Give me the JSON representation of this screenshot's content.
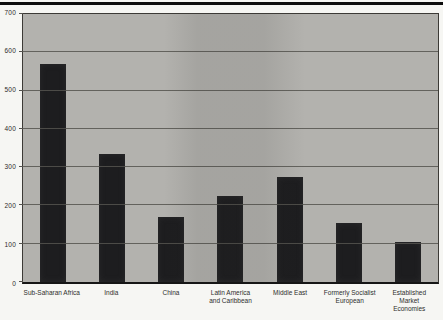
{
  "figure": {
    "background_color": "#f6f6f3",
    "top_rule_color": "#0d0d0d"
  },
  "chart_data": {
    "type": "bar",
    "title": "",
    "xlabel": "",
    "ylabel": "",
    "categories": [
      "Sub-Saharan Africa",
      "India",
      "China",
      "Latin America\nand Caribbean",
      "Middle East",
      "Formerly Socialist\nEuropean",
      "Established\nMarket\nEconomies"
    ],
    "values": [
      570,
      335,
      170,
      225,
      275,
      155,
      105
    ],
    "ylim": [
      0,
      700
    ],
    "yticks": [
      0,
      100,
      200,
      300,
      400,
      500,
      600,
      700
    ],
    "grid": "horizontal",
    "legend": "none",
    "bar_color": "#1d1d1f",
    "plot_background": "#b3b2ae",
    "gridline_color": "#55534f"
  }
}
